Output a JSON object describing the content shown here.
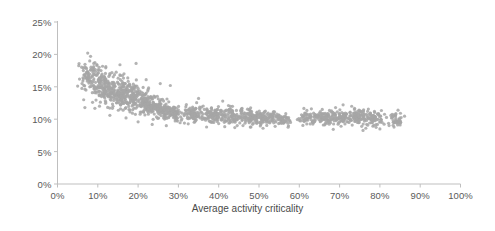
{
  "chart_data": {
    "type": "scatter",
    "title": "",
    "xlabel": "Average activity criticality",
    "ylabel": "",
    "xlim": [
      0,
      100
    ],
    "ylim": [
      0,
      25
    ],
    "grid": false,
    "legend": null,
    "x_tick_labels": [
      "0%",
      "10%",
      "20%",
      "30%",
      "40%",
      "50%",
      "60%",
      "70%",
      "80%",
      "90%",
      "100%"
    ],
    "x_tick_values": [
      0,
      10,
      20,
      30,
      40,
      50,
      60,
      70,
      80,
      90,
      100
    ],
    "y_tick_labels": [
      "0%",
      "5%",
      "10%",
      "15%",
      "20%",
      "25%"
    ],
    "y_tick_values": [
      0,
      5,
      10,
      15,
      20,
      25
    ],
    "marker": {
      "shape": "circle",
      "color": "#a6a6a6",
      "size_px": 3.2,
      "opacity": 0.85
    },
    "series": [
      {
        "name": "observations",
        "point_count": 1400,
        "clusters": [
          {
            "x_center": 8.0,
            "x_spread": 2.2,
            "y_center": 16.4,
            "y_spread": 2.1,
            "n": 95
          },
          {
            "x_center": 11.5,
            "x_spread": 2.2,
            "y_center": 14.9,
            "y_spread": 1.7,
            "n": 110
          },
          {
            "x_center": 15.0,
            "x_spread": 2.4,
            "y_center": 14.2,
            "y_spread": 1.8,
            "n": 125
          },
          {
            "x_center": 18.5,
            "x_spread": 2.4,
            "y_center": 13.4,
            "y_spread": 1.7,
            "n": 130
          },
          {
            "x_center": 22.0,
            "x_spread": 2.4,
            "y_center": 12.4,
            "y_spread": 1.3,
            "n": 120
          },
          {
            "x_center": 25.5,
            "x_spread": 2.3,
            "y_center": 11.7,
            "y_spread": 1.2,
            "n": 110
          },
          {
            "x_center": 29.0,
            "x_spread": 2.0,
            "y_center": 11.0,
            "y_spread": 1.0,
            "n": 85
          },
          {
            "x_center": 34.0,
            "x_spread": 2.2,
            "y_center": 10.8,
            "y_spread": 1.1,
            "n": 80
          },
          {
            "x_center": 38.5,
            "x_spread": 2.2,
            "y_center": 10.7,
            "y_spread": 1.0,
            "n": 85
          },
          {
            "x_center": 43.0,
            "x_spread": 2.4,
            "y_center": 10.5,
            "y_spread": 1.0,
            "n": 90
          },
          {
            "x_center": 47.5,
            "x_spread": 2.4,
            "y_center": 10.3,
            "y_spread": 0.9,
            "n": 90
          },
          {
            "x_center": 52.0,
            "x_spread": 2.4,
            "y_center": 10.2,
            "y_spread": 0.9,
            "n": 85
          },
          {
            "x_center": 56.0,
            "x_spread": 1.6,
            "y_center": 10.0,
            "y_spread": 0.8,
            "n": 45
          },
          {
            "x_center": 62.0,
            "x_spread": 1.8,
            "y_center": 10.2,
            "y_spread": 0.9,
            "n": 55
          },
          {
            "x_center": 66.0,
            "x_spread": 2.0,
            "y_center": 10.3,
            "y_spread": 0.9,
            "n": 70
          },
          {
            "x_center": 70.0,
            "x_spread": 2.0,
            "y_center": 10.3,
            "y_spread": 0.9,
            "n": 70
          },
          {
            "x_center": 74.5,
            "x_spread": 2.2,
            "y_center": 10.4,
            "y_spread": 1.0,
            "n": 85
          },
          {
            "x_center": 78.5,
            "x_spread": 2.0,
            "y_center": 10.2,
            "y_spread": 0.9,
            "n": 70
          },
          {
            "x_center": 84.0,
            "x_spread": 1.4,
            "y_center": 10.0,
            "y_spread": 1.0,
            "n": 40
          }
        ],
        "outliers": [
          {
            "x": 7.5,
            "y": 20.2
          },
          {
            "x": 8.2,
            "y": 19.7
          },
          {
            "x": 8.0,
            "y": 19.0
          },
          {
            "x": 9.0,
            "y": 18.6
          },
          {
            "x": 9.8,
            "y": 18.3
          },
          {
            "x": 7.2,
            "y": 17.8
          },
          {
            "x": 10.8,
            "y": 17.5
          },
          {
            "x": 12.0,
            "y": 18.1
          },
          {
            "x": 13.5,
            "y": 17.2
          },
          {
            "x": 15.5,
            "y": 18.4
          },
          {
            "x": 16.5,
            "y": 17.0
          },
          {
            "x": 19.5,
            "y": 18.6
          },
          {
            "x": 22.0,
            "y": 16.1
          },
          {
            "x": 25.5,
            "y": 15.5
          },
          {
            "x": 28.0,
            "y": 15.2
          },
          {
            "x": 6.5,
            "y": 13.0
          },
          {
            "x": 6.8,
            "y": 11.8
          },
          {
            "x": 13.0,
            "y": 10.6
          },
          {
            "x": 17.0,
            "y": 10.2
          },
          {
            "x": 20.0,
            "y": 9.6
          },
          {
            "x": 23.5,
            "y": 9.2
          },
          {
            "x": 27.0,
            "y": 9.0
          },
          {
            "x": 31.5,
            "y": 9.4
          },
          {
            "x": 35.0,
            "y": 13.2
          },
          {
            "x": 37.0,
            "y": 8.8
          },
          {
            "x": 41.0,
            "y": 12.8
          },
          {
            "x": 44.0,
            "y": 8.7
          },
          {
            "x": 48.0,
            "y": 8.8
          },
          {
            "x": 51.0,
            "y": 8.6
          },
          {
            "x": 54.0,
            "y": 8.9
          },
          {
            "x": 63.0,
            "y": 11.6
          },
          {
            "x": 69.0,
            "y": 11.8
          },
          {
            "x": 73.0,
            "y": 12.0
          },
          {
            "x": 76.5,
            "y": 8.6
          },
          {
            "x": 80.0,
            "y": 8.5
          },
          {
            "x": 84.5,
            "y": 11.4
          }
        ]
      }
    ]
  },
  "axis": {
    "line_color": "#bfbfbf",
    "tick_color": "#bfbfbf",
    "label_color": "#5a5a5a"
  }
}
